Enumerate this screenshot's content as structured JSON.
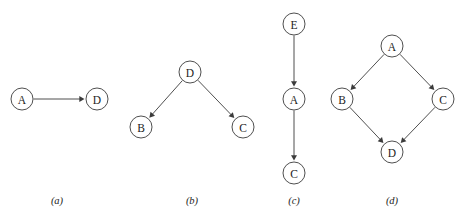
{
  "figure": {
    "width": 463,
    "height": 216,
    "background_color": "#ffffff",
    "stroke_color": "#3b3b3b",
    "text_color": "#1c1c1c",
    "node_radius": 11
  },
  "chart_data": {
    "type": "diagram",
    "subtype": "directed-graph",
    "title": "",
    "panels": [
      {
        "caption": "(a)",
        "caption_x": 57,
        "caption_y": 196,
        "nodes": [
          {
            "id": "a-A",
            "label": "A",
            "x": 22,
            "y": 99
          },
          {
            "id": "a-D",
            "label": "D",
            "x": 97,
            "y": 99
          }
        ],
        "edges": [
          {
            "from": "a-A",
            "to": "a-D",
            "directed": true
          }
        ]
      },
      {
        "caption": "(b)",
        "caption_x": 192,
        "caption_y": 196,
        "nodes": [
          {
            "id": "b-D",
            "label": "D",
            "x": 190,
            "y": 72
          },
          {
            "id": "b-B",
            "label": "B",
            "x": 141,
            "y": 127
          },
          {
            "id": "b-C",
            "label": "C",
            "x": 243,
            "y": 127
          }
        ],
        "edges": [
          {
            "from": "b-D",
            "to": "b-B",
            "directed": true
          },
          {
            "from": "b-D",
            "to": "b-C",
            "directed": true
          }
        ]
      },
      {
        "caption": "(c)",
        "caption_x": 294,
        "caption_y": 196,
        "nodes": [
          {
            "id": "c-E",
            "label": "E",
            "x": 294,
            "y": 24
          },
          {
            "id": "c-A",
            "label": "A",
            "x": 294,
            "y": 99
          },
          {
            "id": "c-C",
            "label": "C",
            "x": 294,
            "y": 173
          }
        ],
        "edges": [
          {
            "from": "c-E",
            "to": "c-A",
            "directed": true
          },
          {
            "from": "c-A",
            "to": "c-C",
            "directed": true
          }
        ]
      },
      {
        "caption": "(d)",
        "caption_x": 392,
        "caption_y": 196,
        "nodes": [
          {
            "id": "d-A",
            "label": "A",
            "x": 392,
            "y": 46
          },
          {
            "id": "d-B",
            "label": "B",
            "x": 342,
            "y": 99
          },
          {
            "id": "d-C",
            "label": "C",
            "x": 443,
            "y": 99
          },
          {
            "id": "d-D",
            "label": "D",
            "x": 392,
            "y": 152
          }
        ],
        "edges": [
          {
            "from": "d-A",
            "to": "d-B",
            "directed": true
          },
          {
            "from": "d-A",
            "to": "d-C",
            "directed": true
          },
          {
            "from": "d-B",
            "to": "d-D",
            "directed": true
          },
          {
            "from": "d-C",
            "to": "d-D",
            "directed": true
          }
        ]
      }
    ]
  }
}
